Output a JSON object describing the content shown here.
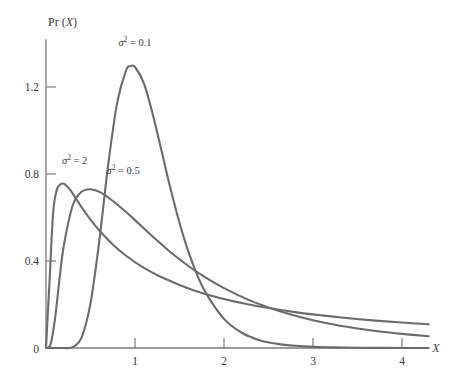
{
  "chart_data": {
    "type": "line",
    "title": "",
    "subtitle": "",
    "xlabel": "X",
    "ylabel": "Pr (X)",
    "xlim": [
      0,
      4.35
    ],
    "ylim": [
      0,
      1.45
    ],
    "xticks": [
      "1",
      "2",
      "3",
      "4"
    ],
    "xtick_values": [
      1,
      2,
      3,
      4
    ],
    "yticks": [
      "0",
      "0.4",
      "0.8",
      "1.2"
    ],
    "ytick_values": [
      0,
      0.4,
      0.8,
      1.2
    ],
    "grid": false,
    "legend": "inline-annotations",
    "distribution": "log-normal",
    "series": [
      {
        "name": "sigma^2 = 0.1",
        "label_sigma": "σ",
        "label_exponent": "2",
        "label_equals": " = 0.1",
        "variance": 0.1,
        "color": "#6b6b6b",
        "peak_x": 0.95,
        "peak_y": 1.3,
        "label_x": 1.0,
        "label_y": 1.39,
        "x": [
          0.0,
          0.1,
          0.2,
          0.3,
          0.4,
          0.5,
          0.6,
          0.7,
          0.8,
          0.9,
          0.95,
          1.0,
          1.1,
          1.2,
          1.3,
          1.4,
          1.5,
          1.6,
          1.7,
          1.8,
          2.0,
          2.2,
          2.4,
          2.6,
          2.8,
          3.0,
          3.2,
          3.5,
          4.0,
          4.3
        ],
        "y": [
          0.0,
          0.0,
          0.0,
          0.004,
          0.049,
          0.205,
          0.497,
          0.846,
          1.128,
          1.277,
          1.295,
          1.292,
          1.217,
          1.074,
          0.903,
          0.731,
          0.576,
          0.443,
          0.335,
          0.25,
          0.134,
          0.07,
          0.036,
          0.019,
          0.01,
          0.005,
          0.003,
          0.001,
          0.0,
          0.0
        ]
      },
      {
        "name": "sigma^2 = 0.5",
        "label_sigma": "σ",
        "label_exponent": "2",
        "label_equals": " = 0.5",
        "variance": 0.5,
        "color": "#6b6b6b",
        "peak_x": 0.61,
        "peak_y": 0.73,
        "label_x": 0.68,
        "label_y": 0.8,
        "x": [
          0.0,
          0.05,
          0.1,
          0.15,
          0.2,
          0.3,
          0.4,
          0.5,
          0.6,
          0.7,
          0.8,
          0.9,
          1.0,
          1.2,
          1.4,
          1.6,
          1.8,
          2.0,
          2.25,
          2.5,
          2.75,
          3.0,
          3.25,
          3.5,
          3.75,
          4.0,
          4.3
        ],
        "y": [
          0.0,
          0.015,
          0.13,
          0.31,
          0.47,
          0.655,
          0.718,
          0.73,
          0.718,
          0.692,
          0.66,
          0.625,
          0.588,
          0.512,
          0.44,
          0.377,
          0.322,
          0.275,
          0.226,
          0.186,
          0.154,
          0.128,
          0.107,
          0.09,
          0.076,
          0.065,
          0.054
        ]
      },
      {
        "name": "sigma^2 = 2",
        "label_sigma": "σ",
        "label_exponent": "2",
        "label_equals": " = 2",
        "variance": 2,
        "color": "#6b6b6b",
        "peak_x": 0.22,
        "peak_y": 0.755,
        "label_x": 0.18,
        "label_y": 0.845,
        "x": [
          0.0,
          0.04,
          0.08,
          0.12,
          0.16,
          0.2,
          0.24,
          0.28,
          0.34,
          0.4,
          0.5,
          0.6,
          0.75,
          0.9,
          1.1,
          1.3,
          1.6,
          1.9,
          2.2,
          2.5,
          2.8,
          3.1,
          3.4,
          3.7,
          4.0,
          4.3
        ],
        "y": [
          0.0,
          0.31,
          0.62,
          0.725,
          0.752,
          0.755,
          0.742,
          0.722,
          0.685,
          0.648,
          0.59,
          0.54,
          0.476,
          0.424,
          0.368,
          0.325,
          0.274,
          0.236,
          0.207,
          0.184,
          0.165,
          0.15,
          0.137,
          0.126,
          0.117,
          0.109
        ]
      }
    ]
  },
  "axes": {
    "y_axis_label_prefix": "Pr (",
    "y_axis_label_var": "X",
    "y_axis_label_suffix": ")",
    "x_axis_label": "X"
  }
}
